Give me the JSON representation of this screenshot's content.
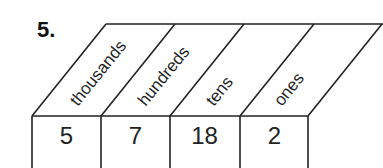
{
  "problem": {
    "number": "5.",
    "columns": [
      {
        "label": "thousands",
        "value": "5"
      },
      {
        "label": "hundreds",
        "value": "7"
      },
      {
        "label": "tens",
        "value": "18"
      },
      {
        "label": "ones",
        "value": "2"
      }
    ]
  }
}
